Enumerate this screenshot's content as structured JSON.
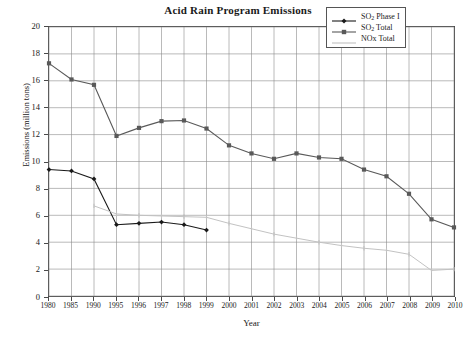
{
  "chart_data": {
    "type": "line",
    "title": "Acid Rain Program Emissions",
    "xlabel": "Year",
    "ylabel": "Emissions (million tons)",
    "grid": true,
    "legend_position": "top-right",
    "xlim": [
      0,
      18
    ],
    "ylim": [
      0,
      20
    ],
    "yticks": [
      0,
      2,
      4,
      6,
      8,
      10,
      12,
      14,
      16,
      18,
      20
    ],
    "categories": [
      "1980",
      "1985",
      "1990",
      "1995",
      "1996",
      "1997",
      "1998",
      "1999",
      "2000",
      "2001",
      "2002",
      "2003",
      "2004",
      "2005",
      "2006",
      "2007",
      "2008",
      "2009",
      "2010"
    ],
    "series": [
      {
        "name": "SO2 Phase I",
        "legend_label": "SO",
        "legend_sub": "2",
        "legend_suffix": " Phase I",
        "color": "#1a1a1a",
        "marker": "diamond",
        "values": [
          9.4,
          9.3,
          8.7,
          5.3,
          5.4,
          5.5,
          5.3,
          4.9,
          null,
          null,
          null,
          null,
          null,
          null,
          null,
          null,
          null,
          null,
          null
        ]
      },
      {
        "name": "SO2 Total",
        "legend_label": "SO",
        "legend_sub": "2",
        "legend_suffix": " Total",
        "color": "#595959",
        "marker": "square",
        "values": [
          17.3,
          16.1,
          15.7,
          11.9,
          12.5,
          13.0,
          13.05,
          12.45,
          11.2,
          10.6,
          10.2,
          10.6,
          10.3,
          10.2,
          9.4,
          8.9,
          7.6,
          5.7,
          5.1
        ]
      },
      {
        "name": "NOx Total",
        "legend_label": "NOx Total",
        "legend_sub": "",
        "legend_suffix": "",
        "color": "#c2c2c2",
        "marker": "tick",
        "values": [
          null,
          null,
          6.7,
          6.1,
          6.0,
          5.95,
          5.9,
          5.85,
          5.4,
          5.0,
          4.6,
          4.3,
          4.0,
          3.75,
          3.55,
          3.4,
          3.1,
          1.9,
          2.0
        ]
      }
    ]
  },
  "legend": {
    "entries": [
      {
        "text": "SO2 Phase I",
        "color": "#1a1a1a"
      },
      {
        "text": "SO2 Total",
        "color": "#595959"
      },
      {
        "text": "NOx Total",
        "color": "#c2c2c2"
      }
    ]
  }
}
